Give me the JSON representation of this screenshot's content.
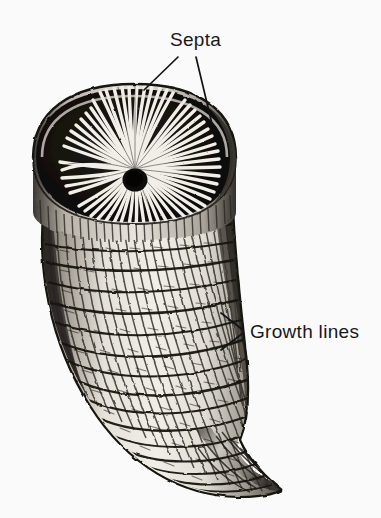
{
  "figure": {
    "kind": "scientific-illustration",
    "background_color": "#fafafa",
    "ink_color": "#131315",
    "paper_tone": "#f1efec"
  },
  "annotations": [
    {
      "id": "septa",
      "label": "Septa",
      "text_x": 170,
      "text_y": 46,
      "leaders": [
        {
          "x1": 178,
          "y1": 57,
          "x2": 144,
          "y2": 90
        },
        {
          "x1": 196,
          "y1": 57,
          "x2": 212,
          "y2": 124
        }
      ]
    },
    {
      "id": "growth-lines",
      "label": "Growth lines",
      "text_x": 250,
      "text_y": 338,
      "leaders": [
        {
          "x1": 243,
          "y1": 330,
          "x2": 221,
          "y2": 313
        },
        {
          "x1": 243,
          "y1": 333,
          "x2": 221,
          "y2": 350
        }
      ]
    }
  ],
  "specimen": {
    "calyx": {
      "center_x": 135,
      "center_y": 180,
      "columella_radius": 11,
      "rim_left_x": 33,
      "rim_right_x": 236,
      "rim_top_y": 84,
      "rim_bottom_y": 222,
      "septa_count": 44,
      "septa_color_light": "#f4f2ee",
      "septa_color_dark": "#14120f"
    },
    "body": {
      "top_left_x": 44,
      "top_right_x": 232,
      "tip_x": 277,
      "tip_y": 492,
      "ridge_count": 26,
      "growth_line_count": 17,
      "wall_color": "#dedad3",
      "shade_color": "#2a2724"
    }
  }
}
